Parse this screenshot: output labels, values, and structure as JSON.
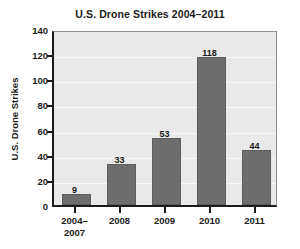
{
  "chart_data": {
    "type": "bar",
    "title": "U.S. Drone Strikes 2004–2011",
    "xlabel": "",
    "ylabel": "U.S. Drone Strikes",
    "categories": [
      "2004–\n2007",
      "2008",
      "2009",
      "2010",
      "2011"
    ],
    "values": [
      9,
      33,
      53,
      118,
      44
    ],
    "value_labels": [
      "9",
      "33",
      "53",
      "118",
      "44"
    ],
    "ylim": [
      0,
      140
    ],
    "yticks": [
      0,
      20,
      40,
      60,
      80,
      100,
      120,
      140
    ],
    "ytick_labels": [
      "0",
      "20",
      "40",
      "60",
      "80",
      "100",
      "120",
      "140"
    ],
    "grid": true,
    "legend": "none",
    "colors": {
      "bar_fill": "#6d6d6d",
      "bar_edge": "#5c5c5c",
      "plot_background": "#e9e9e9",
      "figure_background": "#ffffff",
      "axis": "#1b1b1b",
      "gridline": "#f8f8f8",
      "text": "#1b1b1b"
    }
  }
}
